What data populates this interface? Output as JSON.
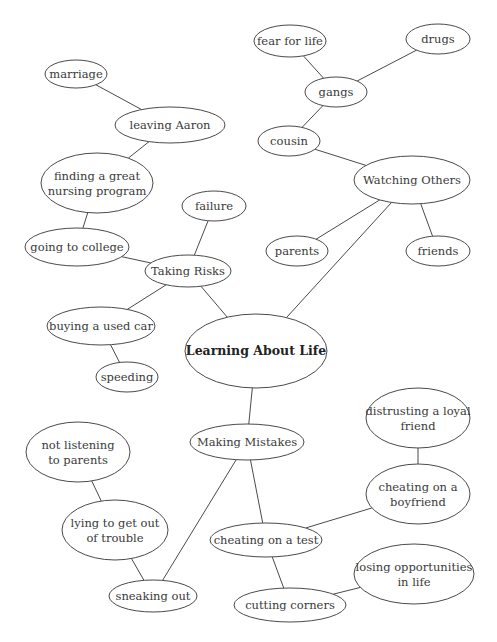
{
  "diagram": {
    "title": "Learning About Life",
    "nodes": [
      {
        "id": "root",
        "label": [
          "Learning About Life"
        ],
        "cx": 256,
        "cy": 351,
        "rx": 71,
        "ry": 37,
        "root": true
      },
      {
        "id": "watching",
        "label": [
          "Watching Others"
        ],
        "cx": 412,
        "cy": 180,
        "rx": 58,
        "ry": 24
      },
      {
        "id": "risks",
        "label": [
          "Taking Risks"
        ],
        "cx": 188,
        "cy": 271,
        "rx": 43,
        "ry": 16
      },
      {
        "id": "mistakes",
        "label": [
          "Making Mistakes"
        ],
        "cx": 247,
        "cy": 442,
        "rx": 57,
        "ry": 18
      },
      {
        "id": "fear",
        "label": [
          "fear for life"
        ],
        "cx": 290,
        "cy": 41,
        "rx": 36,
        "ry": 16
      },
      {
        "id": "drugs",
        "label": [
          "drugs"
        ],
        "cx": 438,
        "cy": 39,
        "rx": 32,
        "ry": 15
      },
      {
        "id": "gangs",
        "label": [
          "gangs"
        ],
        "cx": 336,
        "cy": 92,
        "rx": 31,
        "ry": 15
      },
      {
        "id": "cousin",
        "label": [
          "cousin"
        ],
        "cx": 289,
        "cy": 141,
        "rx": 31,
        "ry": 15
      },
      {
        "id": "parents",
        "label": [
          "parents"
        ],
        "cx": 297,
        "cy": 251,
        "rx": 31,
        "ry": 15
      },
      {
        "id": "friends",
        "label": [
          "friends"
        ],
        "cx": 438,
        "cy": 251,
        "rx": 32,
        "ry": 15
      },
      {
        "id": "marriage",
        "label": [
          "marriage"
        ],
        "cx": 76,
        "cy": 74,
        "rx": 31,
        "ry": 14
      },
      {
        "id": "aaron",
        "label": [
          "leaving Aaron"
        ],
        "cx": 170,
        "cy": 125,
        "rx": 55,
        "ry": 18
      },
      {
        "id": "nursing",
        "label": [
          "finding a great",
          "nursing program"
        ],
        "cx": 97,
        "cy": 183,
        "rx": 56,
        "ry": 30
      },
      {
        "id": "failure",
        "label": [
          "failure"
        ],
        "cx": 214,
        "cy": 206,
        "rx": 32,
        "ry": 15
      },
      {
        "id": "college",
        "label": [
          "going to college"
        ],
        "cx": 77,
        "cy": 247,
        "rx": 52,
        "ry": 19
      },
      {
        "id": "car",
        "label": [
          "buying a used car"
        ],
        "cx": 101,
        "cy": 326,
        "rx": 54,
        "ry": 19
      },
      {
        "id": "speeding",
        "label": [
          "speeding"
        ],
        "cx": 127,
        "cy": 377,
        "rx": 31,
        "ry": 15
      },
      {
        "id": "notlistening",
        "label": [
          "not listening",
          "to parents"
        ],
        "cx": 78,
        "cy": 452,
        "rx": 52,
        "ry": 30
      },
      {
        "id": "lying",
        "label": [
          "lying to get out",
          "of trouble"
        ],
        "cx": 115,
        "cy": 530,
        "rx": 53,
        "ry": 30
      },
      {
        "id": "sneaking",
        "label": [
          "sneaking out"
        ],
        "cx": 153,
        "cy": 596,
        "rx": 44,
        "ry": 16
      },
      {
        "id": "distrust",
        "label": [
          "distrusting a loyal",
          "friend"
        ],
        "cx": 418,
        "cy": 418,
        "rx": 52,
        "ry": 30
      },
      {
        "id": "boyfriend",
        "label": [
          "cheating on a",
          "boyfriend"
        ],
        "cx": 418,
        "cy": 494,
        "rx": 52,
        "ry": 30
      },
      {
        "id": "test",
        "label": [
          "cheating on a test"
        ],
        "cx": 266,
        "cy": 540,
        "rx": 56,
        "ry": 17
      },
      {
        "id": "opportunities",
        "label": [
          "losing opportunities",
          "in life"
        ],
        "cx": 414,
        "cy": 574,
        "rx": 60,
        "ry": 30
      },
      {
        "id": "corners",
        "label": [
          "cutting corners"
        ],
        "cx": 290,
        "cy": 605,
        "rx": 56,
        "ry": 17
      }
    ],
    "edges": [
      [
        "root",
        "watching"
      ],
      [
        "root",
        "risks"
      ],
      [
        "root",
        "mistakes"
      ],
      [
        "watching",
        "cousin"
      ],
      [
        "watching",
        "parents"
      ],
      [
        "watching",
        "friends"
      ],
      [
        "cousin",
        "gangs"
      ],
      [
        "gangs",
        "fear"
      ],
      [
        "gangs",
        "drugs"
      ],
      [
        "risks",
        "failure"
      ],
      [
        "risks",
        "college"
      ],
      [
        "risks",
        "car"
      ],
      [
        "car",
        "speeding"
      ],
      [
        "college",
        "nursing"
      ],
      [
        "nursing",
        "aaron"
      ],
      [
        "aaron",
        "marriage"
      ],
      [
        "mistakes",
        "sneaking"
      ],
      [
        "mistakes",
        "test"
      ],
      [
        "sneaking",
        "lying"
      ],
      [
        "lying",
        "notlistening"
      ],
      [
        "test",
        "boyfriend"
      ],
      [
        "boyfriend",
        "distrust"
      ],
      [
        "test",
        "corners"
      ],
      [
        "corners",
        "opportunities"
      ]
    ]
  }
}
